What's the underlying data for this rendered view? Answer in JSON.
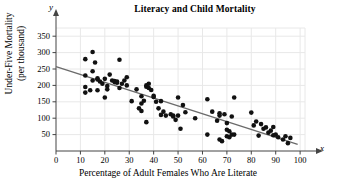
{
  "chart_data": {
    "type": "scatter",
    "title": "Literacy and Child Mortality",
    "xlabel": "Percentage of Adult Females Who Are Literate",
    "ylabel": "Under-Five Mortality\n(per thousand)",
    "ylabel_line1": "Under-Five Mortality",
    "ylabel_line2": "(per thousand)",
    "x_axis_letter": "x",
    "y_axis_letter": "y",
    "xlim": [
      0,
      102
    ],
    "ylim": [
      0,
      375
    ],
    "xticks": [
      0,
      10,
      20,
      30,
      40,
      50,
      60,
      70,
      80,
      90,
      100
    ],
    "yticks": [
      50,
      100,
      150,
      200,
      250,
      300,
      350
    ],
    "grid": true,
    "grid_color": "#e8e8e8",
    "point_color": "#111111",
    "point_radius": 2.3,
    "trendline": {
      "label": "least-squares regression line",
      "color": "#6b6b6b",
      "x_start": 0,
      "y_start": 257,
      "x_end": 99,
      "y_end": 20,
      "slope": -2.39,
      "intercept": 257
    },
    "points": [
      [
        12,
        280
      ],
      [
        12,
        230
      ],
      [
        12,
        195
      ],
      [
        12,
        178
      ],
      [
        14,
        185
      ],
      [
        15,
        302
      ],
      [
        15,
        243
      ],
      [
        15,
        215
      ],
      [
        16,
        270
      ],
      [
        17,
        222
      ],
      [
        17,
        218
      ],
      [
        17,
        185
      ],
      [
        18,
        212
      ],
      [
        19,
        205
      ],
      [
        20,
        220
      ],
      [
        20,
        163
      ],
      [
        21,
        198
      ],
      [
        21,
        188
      ],
      [
        22,
        233
      ],
      [
        23,
        215
      ],
      [
        24,
        210
      ],
      [
        24,
        213
      ],
      [
        25,
        212
      ],
      [
        25,
        208
      ],
      [
        26,
        278
      ],
      [
        26,
        192
      ],
      [
        27,
        205
      ],
      [
        28,
        215
      ],
      [
        29,
        225
      ],
      [
        29,
        200
      ],
      [
        31,
        152
      ],
      [
        33,
        188
      ],
      [
        34,
        130
      ],
      [
        35,
        167
      ],
      [
        35,
        145
      ],
      [
        35,
        122
      ],
      [
        36,
        153
      ],
      [
        37,
        200
      ],
      [
        37,
        196
      ],
      [
        37,
        88
      ],
      [
        38,
        205
      ],
      [
        38,
        192
      ],
      [
        39,
        186
      ],
      [
        40,
        168
      ],
      [
        40,
        165
      ],
      [
        41,
        150
      ],
      [
        42,
        130
      ],
      [
        43,
        110
      ],
      [
        43,
        152
      ],
      [
        44,
        120
      ],
      [
        45,
        108
      ],
      [
        47,
        112
      ],
      [
        48,
        105
      ],
      [
        48,
        108
      ],
      [
        49,
        95
      ],
      [
        50,
        163
      ],
      [
        50,
        108
      ],
      [
        51,
        68
      ],
      [
        52,
        140
      ],
      [
        53,
        118
      ],
      [
        57,
        100
      ],
      [
        62,
        158
      ],
      [
        62,
        50
      ],
      [
        64,
        120
      ],
      [
        66,
        92
      ],
      [
        67,
        108
      ],
      [
        67,
        115
      ],
      [
        67,
        35
      ],
      [
        68,
        30
      ],
      [
        69,
        112
      ],
      [
        70,
        85
      ],
      [
        70,
        65
      ],
      [
        70,
        45
      ],
      [
        71,
        60
      ],
      [
        71,
        42
      ],
      [
        72,
        105
      ],
      [
        72,
        50
      ],
      [
        73,
        163
      ],
      [
        73,
        50
      ],
      [
        80,
        117
      ],
      [
        81,
        78
      ],
      [
        82,
        90
      ],
      [
        83,
        47
      ],
      [
        84,
        82
      ],
      [
        85,
        68
      ],
      [
        86,
        72
      ],
      [
        87,
        56
      ],
      [
        88,
        62
      ],
      [
        89,
        73
      ],
      [
        89,
        48
      ],
      [
        90,
        50
      ],
      [
        91,
        42
      ],
      [
        93,
        35
      ],
      [
        94,
        45
      ],
      [
        95,
        24
      ],
      [
        96,
        40
      ]
    ]
  }
}
